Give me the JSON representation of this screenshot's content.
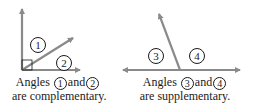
{
  "colors": {
    "line": "#8a8a8a",
    "text": "#1a1a1a",
    "background": "#ffffff"
  },
  "left_diagram": {
    "angle_labels": [
      "1",
      "2"
    ],
    "caption": {
      "prefix": "Angles",
      "first": "1",
      "conjunction": "and",
      "second": "2",
      "line2": "are complementary."
    }
  },
  "right_diagram": {
    "angle_labels": [
      "3",
      "4"
    ],
    "caption": {
      "prefix": "Angles",
      "first": "3",
      "conjunction": "and",
      "second": "4",
      "line2": "are supplementary."
    }
  }
}
